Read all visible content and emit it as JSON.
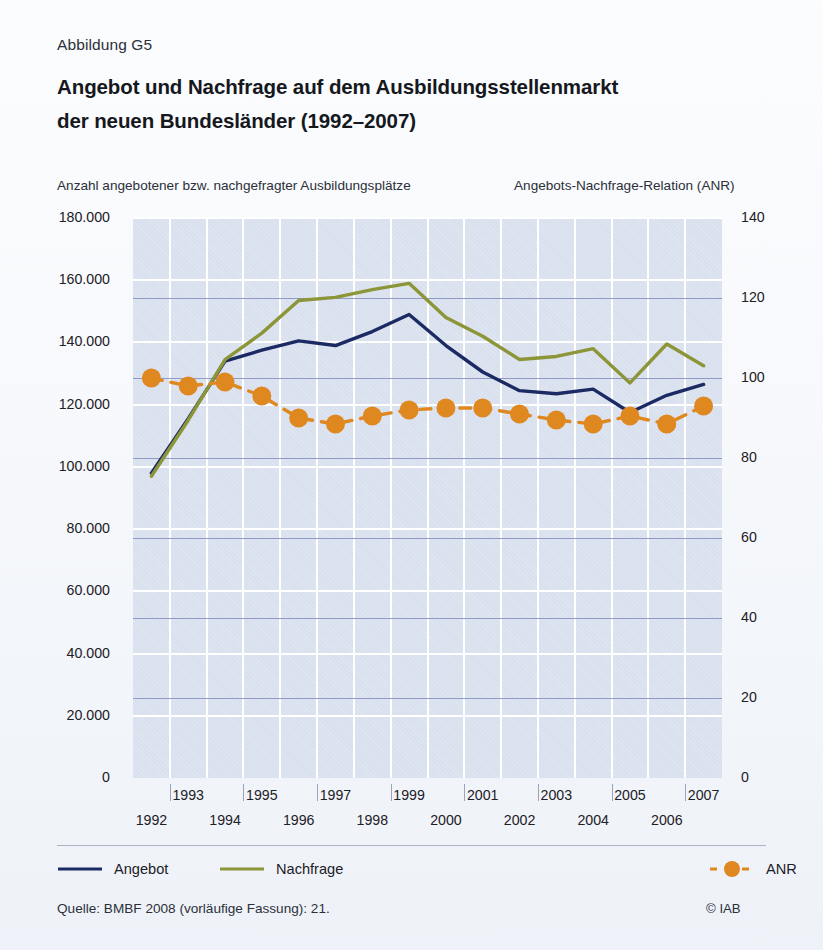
{
  "figure": {
    "label": "Abbildung G5",
    "title_line1": "Angebot und Nachfrage auf dem Ausbildungsstellenmarkt",
    "title_line2": "der neuen Bundesländer (1992–2007)",
    "source": "Quelle: BMBF 2008 (vorläufige Fassung): 21.",
    "copyright": "© IAB"
  },
  "colors": {
    "angebot": "#1b2a63",
    "nachfrage": "#8c9638",
    "anr": "#e08820",
    "plot_background": "#d9e0ee",
    "grid_white": "#ffffff",
    "grid_blue": "#8e9bc4",
    "page_background": "#fbfcfe",
    "text": "#1d2026"
  },
  "chart_data": {
    "type": "line",
    "title": "Angebot und Nachfrage auf dem Ausbildungsstellenmarkt der neuen Bundesländer (1992–2007)",
    "subtitle": "Abbildung G5",
    "xlabel": "",
    "ylabel": "Anzahl angebotener bzw. nachgefragter Ausbildungsplätze",
    "y2label": "Angebots-Nachfrage-Relation (ANR)",
    "x": [
      1992,
      1993,
      1994,
      1995,
      1996,
      1997,
      1998,
      1999,
      2000,
      2001,
      2002,
      2003,
      2004,
      2005,
      2006,
      2007
    ],
    "categories": [
      "1992",
      "1993",
      "1994",
      "1995",
      "1996",
      "1997",
      "1998",
      "1999",
      "2000",
      "2001",
      "2002",
      "2003",
      "2004",
      "2005",
      "2006",
      "2007"
    ],
    "xlim": [
      1992,
      2007
    ],
    "ylim": [
      0,
      180000
    ],
    "y2lim": [
      0,
      140
    ],
    "yticks": [
      0,
      20000,
      40000,
      60000,
      80000,
      100000,
      120000,
      140000,
      160000,
      180000
    ],
    "ytick_labels": [
      "0",
      "20.000",
      "40.000",
      "60.000",
      "80.000",
      "100.000",
      "120.000",
      "140.000",
      "160.000",
      "180.000"
    ],
    "y2ticks": [
      0,
      20,
      40,
      60,
      80,
      100,
      120,
      140
    ],
    "y2tick_labels": [
      "0",
      "20",
      "40",
      "60",
      "80",
      "100",
      "120",
      "140"
    ],
    "grid": true,
    "legend_position": "bottom",
    "series": [
      {
        "name": "Angebot",
        "axis": "left",
        "color": "#1b2a63",
        "style": "solid",
        "marker": "none",
        "values": [
          98000,
          115500,
          134000,
          137500,
          140500,
          139000,
          143500,
          149000,
          139000,
          130500,
          124500,
          123500,
          125000,
          117500,
          123000,
          126500
        ]
      },
      {
        "name": "Nachfrage",
        "axis": "left",
        "color": "#8c9638",
        "style": "solid",
        "marker": "none",
        "values": [
          97000,
          115000,
          134500,
          143000,
          153500,
          154500,
          157000,
          159000,
          148000,
          142000,
          134500,
          135500,
          138000,
          127000,
          139500,
          132500
        ]
      },
      {
        "name": "ANR",
        "axis": "right",
        "color": "#e08820",
        "style": "dashed",
        "marker": "circle",
        "values": [
          100.0,
          98.0,
          99.0,
          95.5,
          90.0,
          88.5,
          90.5,
          92.0,
          92.5,
          92.5,
          91.0,
          89.5,
          88.5,
          90.5,
          88.5,
          93.0
        ]
      }
    ]
  },
  "legend": {
    "items": [
      {
        "label": "Angebot",
        "color": "#1b2a63",
        "style": "solid",
        "marker": false
      },
      {
        "label": "Nachfrage",
        "color": "#8c9638",
        "style": "solid",
        "marker": false
      },
      {
        "label": "ANR",
        "color": "#e08820",
        "style": "dashed",
        "marker": true
      }
    ]
  }
}
